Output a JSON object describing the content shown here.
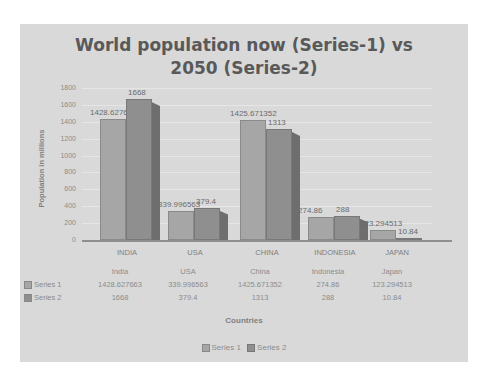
{
  "chart_data": {
    "type": "bar",
    "title": "World population now (Series-1) vs 2050 (Series-2)",
    "title_lines": [
      "World population now (Series-1) vs",
      "2050 (Series-2)"
    ],
    "xlabel": "Countries",
    "ylabel": "Population in millions",
    "ylim": [
      0,
      1800
    ],
    "yticks": [
      "1800",
      "1600",
      "1400",
      "1200",
      "1000",
      "800",
      "600",
      "400",
      "200",
      "0"
    ],
    "categories": [
      "INDIA",
      "USA",
      "CHINA",
      "INDONESIA",
      "JAPAN"
    ],
    "table_categories": [
      "India",
      "USA",
      "China",
      "Indonesia",
      "Japan"
    ],
    "series": [
      {
        "name": "Series 1",
        "values": [
          1428.627663,
          339.996563,
          1425.671352,
          274.86,
          123.294513
        ],
        "labels": [
          "1428.627663",
          "339.996563",
          "1425.671352",
          "274.86",
          "123.294513"
        ],
        "color": "#a6a6a6"
      },
      {
        "name": "Series 2",
        "values": [
          1668,
          379.4,
          1313,
          288,
          10.84
        ],
        "labels": [
          "1668",
          "379.4",
          "1313",
          "288",
          "10.84"
        ],
        "color": "#8f8f8f"
      }
    ],
    "grid": true,
    "legend_position": "bottom",
    "data_table": true,
    "style": "3d-clustered-column"
  }
}
